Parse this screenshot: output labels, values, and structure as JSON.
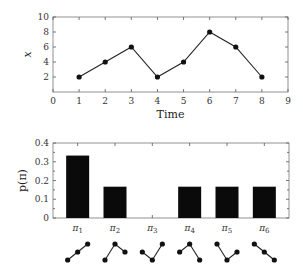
{
  "chart_data": [
    {
      "type": "line",
      "title": "",
      "xlabel": "Time",
      "ylabel": "x",
      "xlim": [
        0,
        9
      ],
      "ylim": [
        0,
        10
      ],
      "x_ticks": [
        "0",
        "1",
        "2",
        "3",
        "4",
        "5",
        "6",
        "7",
        "8",
        "9"
      ],
      "y_ticks": [
        "2",
        "4",
        "6",
        "8",
        "10"
      ],
      "grid": false,
      "series": [
        {
          "name": "x",
          "x": [
            1,
            2,
            3,
            4,
            5,
            6,
            7,
            8
          ],
          "values": [
            2,
            4,
            6,
            2,
            4,
            8,
            6,
            2
          ]
        }
      ]
    },
    {
      "type": "bar",
      "title": "",
      "xlabel": "",
      "ylabel": "p(π)",
      "ylim": [
        0,
        0.4
      ],
      "y_ticks": [
        "0",
        "0.1",
        "0.2",
        "0.3",
        "0.4"
      ],
      "categories": [
        "π1",
        "π2",
        "π3",
        "π4",
        "π5",
        "π6"
      ],
      "category_labels": [
        {
          "base": "π",
          "sub": "1"
        },
        {
          "base": "π",
          "sub": "2"
        },
        {
          "base": "π",
          "sub": "3"
        },
        {
          "base": "π",
          "sub": "4"
        },
        {
          "base": "π",
          "sub": "5"
        },
        {
          "base": "π",
          "sub": "6"
        }
      ],
      "values": [
        0.333,
        0.167,
        0,
        0.167,
        0.167,
        0.167
      ],
      "grid": false,
      "pattern_glyphs": [
        {
          "name": "increasing",
          "ranks": [
            0,
            1,
            2
          ]
        },
        {
          "name": "up-down-high",
          "ranks": [
            0,
            2,
            1
          ]
        },
        {
          "name": "down-up-high",
          "ranks": [
            1,
            0,
            2
          ]
        },
        {
          "name": "up-down-low",
          "ranks": [
            1,
            2,
            0
          ]
        },
        {
          "name": "down-up-low",
          "ranks": [
            2,
            0,
            1
          ]
        },
        {
          "name": "decreasing",
          "ranks": [
            2,
            1,
            0
          ]
        }
      ]
    }
  ],
  "top_chart": {
    "xlabel": "Time",
    "ylabel": "x"
  },
  "bottom_chart": {
    "ylabel": "p(π)"
  }
}
